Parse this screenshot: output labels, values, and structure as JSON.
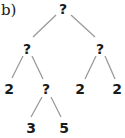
{
  "diagram": {
    "panel_label": "b)",
    "type": "binary-tree",
    "nodes": [
      {
        "id": "root",
        "label": "?",
        "x": 63,
        "y": 8
      },
      {
        "id": "left",
        "label": "?",
        "x": 27,
        "y": 48
      },
      {
        "id": "right",
        "label": "?",
        "x": 100,
        "y": 48
      },
      {
        "id": "left-left",
        "label": "2",
        "x": 9,
        "y": 89
      },
      {
        "id": "left-right",
        "label": "?",
        "x": 46,
        "y": 89
      },
      {
        "id": "right-left",
        "label": "2",
        "x": 80,
        "y": 89
      },
      {
        "id": "right-right",
        "label": "2",
        "x": 117,
        "y": 89
      },
      {
        "id": "left-right-left",
        "label": "3",
        "x": 31,
        "y": 128
      },
      {
        "id": "left-right-right",
        "label": "5",
        "x": 64,
        "y": 128
      }
    ],
    "edges": [
      [
        "root",
        "left"
      ],
      [
        "root",
        "right"
      ],
      [
        "left",
        "left-left"
      ],
      [
        "left",
        "left-right"
      ],
      [
        "right",
        "right-left"
      ],
      [
        "right",
        "right-right"
      ],
      [
        "left-right",
        "left-right-left"
      ],
      [
        "left-right",
        "left-right-right"
      ]
    ]
  }
}
